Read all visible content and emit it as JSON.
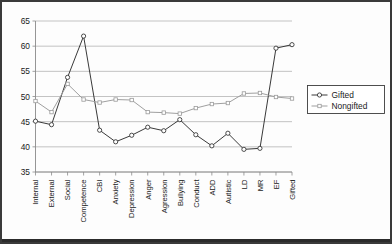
{
  "chart_data": {
    "type": "line",
    "title": "",
    "xlabel": "",
    "ylabel": "",
    "ylim": [
      35,
      65
    ],
    "yticks": [
      35,
      40,
      45,
      50,
      55,
      60,
      65
    ],
    "grid": true,
    "legend_position": "right",
    "categories": [
      "Internal",
      "External",
      "Social",
      "Competence",
      "CBI",
      "Anxiety",
      "Depression",
      "Anger",
      "Agression",
      "Bullying",
      "Conduct",
      "ADD",
      "Autistic",
      "LD",
      "MR",
      "EF",
      "Gifted"
    ],
    "series": [
      {
        "name": "Gifted",
        "marker": "open-circle",
        "color": "#2e2e2e",
        "values": [
          45.1,
          44.4,
          53.8,
          62.0,
          43.3,
          41.0,
          42.3,
          43.9,
          43.2,
          45.4,
          42.4,
          40.2,
          42.7,
          39.5,
          39.7,
          59.6,
          60.3
        ]
      },
      {
        "name": "Nongifted",
        "marker": "open-square",
        "color": "#9a9a9a",
        "values": [
          49.1,
          46.9,
          52.5,
          49.4,
          48.8,
          49.4,
          49.3,
          46.9,
          46.8,
          46.6,
          47.7,
          48.5,
          48.7,
          50.6,
          50.7,
          49.9,
          49.6
        ]
      }
    ]
  },
  "legend": {
    "entries": [
      {
        "label": "Gifted"
      },
      {
        "label": "Nongifted"
      }
    ]
  },
  "colors": {
    "gifted": "#2e2e2e",
    "nongifted": "#9a9a9a",
    "grid": "#b4b4b4",
    "axis": "#8a8a8a",
    "frame": "#3a3a3a"
  }
}
